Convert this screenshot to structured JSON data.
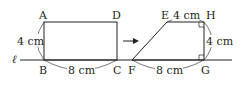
{
  "diagram": {
    "line_label": "ℓ",
    "rectangle": {
      "vertices": {
        "A": "A",
        "B": "B",
        "C": "C",
        "D": "D"
      },
      "height_label": "4 cm",
      "width_label": "8 cm"
    },
    "arrow": "→",
    "trapezoid": {
      "vertices": {
        "E": "E",
        "F": "F",
        "G": "G",
        "H": "H"
      },
      "top_label": "4 cm",
      "height_label": "4 cm",
      "bottom_label": "8 cm"
    },
    "colors": {
      "stroke": "#231f20",
      "background": "#ffffff"
    }
  }
}
